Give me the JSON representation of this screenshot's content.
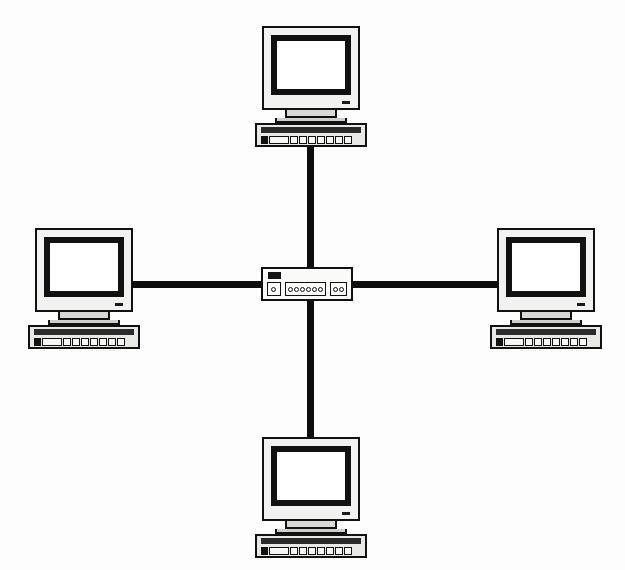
{
  "diagram": {
    "background_color": "#ffffff",
    "line_color": "#0d0d0d",
    "device_fill_color": "#f2f2f0",
    "screen_color": "#ffffff",
    "bezel_color": "#111111"
  },
  "hub": {
    "label": "network-hub",
    "led_indicator": "status-led",
    "port_groups": [
      {
        "name": "uplink-port",
        "count": 1
      },
      {
        "name": "main-ports",
        "count": 6
      },
      {
        "name": "aux-ports",
        "count": 2
      }
    ]
  },
  "nodes": [
    {
      "id": "top",
      "label": "workstation-top",
      "position": "top",
      "connects_to": "hub"
    },
    {
      "id": "left",
      "label": "workstation-left",
      "position": "left",
      "connects_to": "hub"
    },
    {
      "id": "right",
      "label": "workstation-right",
      "position": "right",
      "connects_to": "hub"
    },
    {
      "id": "bottom",
      "label": "workstation-bottom",
      "position": "bottom",
      "connects_to": "hub"
    }
  ],
  "links": [
    {
      "name": "cable-top",
      "from": "workstation-top",
      "to": "hub",
      "orientation": "vertical"
    },
    {
      "name": "cable-left",
      "from": "workstation-left",
      "to": "hub",
      "orientation": "horizontal"
    },
    {
      "name": "cable-right",
      "from": "workstation-right",
      "to": "hub",
      "orientation": "horizontal"
    },
    {
      "name": "cable-bottom",
      "from": "workstation-bottom",
      "to": "hub",
      "orientation": "vertical"
    }
  ],
  "keyboard": {
    "key_count": 9,
    "has_spacebar": true,
    "has_logo": true
  }
}
